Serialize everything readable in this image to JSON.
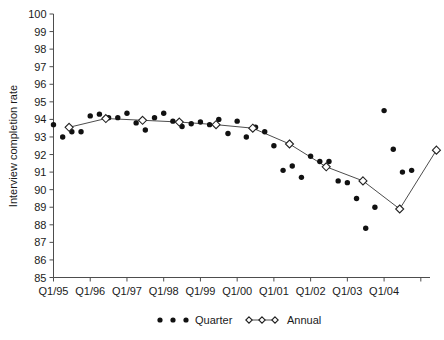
{
  "chart_data": {
    "type": "scatter",
    "title": "",
    "xlabel": "",
    "ylabel": "Interview completion rate",
    "ylim": [
      85,
      100
    ],
    "ytick_step": 1,
    "yticks": [
      85,
      86,
      87,
      88,
      89,
      90,
      91,
      92,
      93,
      94,
      95,
      96,
      97,
      98,
      99,
      100
    ],
    "xtick_labels": [
      "Q1/95",
      "Q1/96",
      "Q1/97",
      "Q1/98",
      "Q1/99",
      "Q1/00",
      "Q1/01",
      "Q1/02",
      "Q1/03",
      "Q1/04"
    ],
    "xlim_quarters": [
      0,
      41
    ],
    "grid": false,
    "legend_position": "bottom",
    "series": [
      {
        "name": "Quarter",
        "marker": "filled-circle",
        "color": "#111111",
        "x": [
          "Q1/95",
          "Q2/95",
          "Q3/95",
          "Q4/95",
          "Q1/96",
          "Q2/96",
          "Q3/96",
          "Q4/96",
          "Q1/97",
          "Q2/97",
          "Q3/97",
          "Q4/97",
          "Q1/98",
          "Q2/98",
          "Q3/98",
          "Q4/98",
          "Q1/99",
          "Q2/99",
          "Q3/99",
          "Q4/99",
          "Q1/00",
          "Q2/00",
          "Q3/00",
          "Q4/00",
          "Q1/01",
          "Q2/01",
          "Q3/01",
          "Q4/01",
          "Q1/02",
          "Q2/02",
          "Q3/02",
          "Q4/02",
          "Q1/03",
          "Q2/03",
          "Q3/03",
          "Q4/03",
          "Q1/04",
          "Q2/04",
          "Q3/04",
          "Q4/04"
        ],
        "values": [
          93.7,
          93.0,
          93.3,
          93.3,
          94.2,
          94.3,
          94.1,
          94.1,
          94.35,
          93.8,
          93.4,
          94.1,
          94.35,
          93.9,
          93.6,
          93.75,
          93.85,
          93.7,
          94.0,
          93.2,
          93.9,
          93.0,
          93.55,
          93.3,
          92.5,
          91.1,
          91.35,
          90.7,
          91.9,
          91.6,
          91.6,
          90.5,
          90.4,
          89.5,
          87.8,
          89.0,
          94.5,
          92.3,
          91.0,
          91.1
        ],
        "count": 40
      },
      {
        "name": "Annual",
        "marker": "open-diamond",
        "color": "#4d4d4d",
        "x": [
          "1995",
          "1996",
          "1997",
          "1998",
          "1999",
          "2000",
          "2001",
          "2002",
          "2003",
          "2004"
        ],
        "plotted_at": [
          "Q2-Q3/95",
          "Q2-Q3/96",
          "Q2-Q3/97",
          "Q2-Q3/98",
          "Q2-Q3/99",
          "Q2-Q3/00",
          "Q2-Q3/01",
          "Q2-Q3/02",
          "Q2-Q3/03",
          "Q2-Q3/04"
        ],
        "values": [
          93.55,
          94.05,
          93.95,
          93.85,
          93.7,
          93.5,
          92.6,
          91.3,
          90.5,
          88.9
        ],
        "tail_value": 92.25,
        "count": 10
      }
    ],
    "legend": [
      {
        "label": "Quarter",
        "marker": "filled-circle"
      },
      {
        "label": "Annual",
        "marker": "open-diamond-line"
      }
    ]
  }
}
